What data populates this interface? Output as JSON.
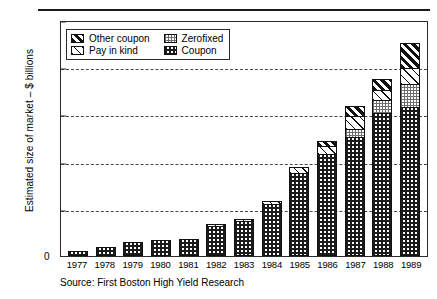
{
  "figure": {
    "source_note": "Source: First Boston High Yield Research",
    "zero_label": "0"
  },
  "chart_data": {
    "type": "bar",
    "stacked": true,
    "title": "",
    "xlabel": "",
    "ylabel": "Estimated size of market – $ billions",
    "ylim": [
      0,
      250
    ],
    "yticks": [
      0,
      50,
      100,
      150,
      200,
      250
    ],
    "ytick_labels": [
      "0",
      "50",
      "100",
      "150",
      "200",
      "250"
    ],
    "grid": "horizontal-dashed",
    "legend_position": "upper-left-inside",
    "categories": [
      "1977",
      "1978",
      "1979",
      "1980",
      "1981",
      "1982",
      "1983",
      "1984",
      "1985",
      "1986",
      "1987",
      "1988",
      "1989"
    ],
    "series": [
      {
        "name": "Coupon",
        "pattern": "dark-checker",
        "values": [
          5,
          10,
          15,
          17,
          18,
          32,
          37,
          55,
          88,
          108,
          126,
          152,
          158
        ]
      },
      {
        "name": "Zerofixed",
        "pattern": "light-checker",
        "values": [
          0,
          0,
          0,
          0,
          0,
          0,
          0,
          0,
          0,
          0,
          10,
          14,
          25
        ]
      },
      {
        "name": "Pay in kind",
        "pattern": "white-diagonal",
        "values": [
          0,
          0,
          0,
          0,
          0,
          2,
          3,
          4,
          7,
          10,
          14,
          12,
          18
        ]
      },
      {
        "name": "Other coupon",
        "pattern": "dark-diagonal",
        "values": [
          0,
          0,
          0,
          0,
          0,
          0,
          0,
          0,
          0,
          6,
          12,
          13,
          28
        ]
      }
    ],
    "totals": [
      5,
      10,
      15,
      17,
      18,
      34,
      40,
      59,
      95,
      124,
      162,
      191,
      229
    ],
    "legend": [
      {
        "label": "Other coupon",
        "pattern": "dark-diagonal"
      },
      {
        "label": "Zerofixed",
        "pattern": "light-checker"
      },
      {
        "label": "Pay in kind",
        "pattern": "white-diagonal"
      },
      {
        "label": "Coupon",
        "pattern": "dark-checker"
      }
    ]
  }
}
